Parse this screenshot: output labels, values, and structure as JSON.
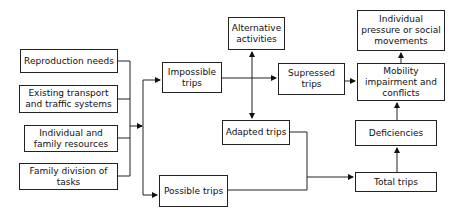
{
  "diagram": {
    "type": "flowchart",
    "nodes": {
      "reproduction_needs": "Reproduction needs",
      "existing_transport": "Existing transport and traffic systems",
      "individual_family_resources": "Individual and family resources",
      "family_division_tasks": "Family division of tasks",
      "impossible_trips": "Impossible trips",
      "possible_trips": "Possible trips",
      "alternative_activities": "Alternative activities",
      "adapted_trips": "Adapted trips",
      "supressed_trips": "Supressed trips",
      "mobility_impairment": "Mobility impairment and conflicts",
      "individual_pressure": "Individual pressure or social movements",
      "deficiencies": "Deficiencies",
      "total_trips": "Total trips"
    },
    "edges": [
      {
        "from": "inputs",
        "to": "impossible_trips"
      },
      {
        "from": "inputs",
        "to": "possible_trips"
      },
      {
        "from": "impossible_trips",
        "to": "supressed_trips"
      },
      {
        "from": "impossible_trips",
        "to": "alternative_activities"
      },
      {
        "from": "impossible_trips",
        "to": "adapted_trips"
      },
      {
        "from": "supressed_trips",
        "to": "mobility_impairment"
      },
      {
        "from": "mobility_impairment",
        "to": "individual_pressure"
      },
      {
        "from": "adapted_trips",
        "to": "total_trips"
      },
      {
        "from": "possible_trips",
        "to": "total_trips"
      },
      {
        "from": "total_trips",
        "to": "deficiencies"
      },
      {
        "from": "deficiencies",
        "to": "mobility_impairment"
      }
    ]
  }
}
